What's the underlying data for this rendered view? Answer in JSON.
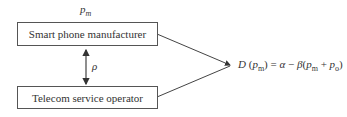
{
  "diagram": {
    "price_label": "p_m",
    "price_label_display": "pm",
    "top_box": "Smart phone manufacturer",
    "bottom_box": "Telecom service operator",
    "link_label": "ρ",
    "formula": "D (p_m) = α − β(p_m + p_o)"
  }
}
